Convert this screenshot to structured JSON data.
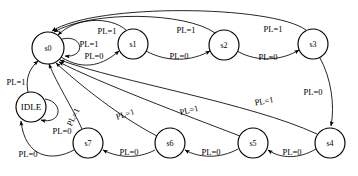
{
  "diagram": {
    "type": "finite-state-machine",
    "title": "",
    "canvas": {
      "width": 358,
      "height": 176
    },
    "stroke_color": "#000000",
    "fill_color": "#ffffff",
    "background": "#ffffff",
    "states": [
      {
        "id": "s0",
        "label": "s0",
        "cx": 48,
        "cy": 48,
        "r": 16
      },
      {
        "id": "s1",
        "label": "s1",
        "cx": 133,
        "cy": 44,
        "r": 15
      },
      {
        "id": "s2",
        "label": "s2",
        "cx": 224,
        "cy": 45,
        "r": 15
      },
      {
        "id": "s3",
        "label": "s3",
        "cx": 313,
        "cy": 44,
        "r": 15
      },
      {
        "id": "s4",
        "label": "s4",
        "cx": 330,
        "cy": 143,
        "r": 15
      },
      {
        "id": "s5",
        "label": "s5",
        "cx": 253,
        "cy": 143,
        "r": 15
      },
      {
        "id": "s6",
        "label": "s6",
        "cx": 170,
        "cy": 143,
        "r": 15
      },
      {
        "id": "s7",
        "label": "s7",
        "cx": 88,
        "cy": 143,
        "r": 15
      },
      {
        "id": "IDLE",
        "label": "IDLE",
        "cx": 31,
        "cy": 107,
        "r": 15
      }
    ],
    "transitions": [
      {
        "id": "t-s0-s0",
        "from": "s0",
        "to": "s0",
        "label": "PL=1",
        "label_x": 89,
        "label_y": 44
      },
      {
        "id": "t-s0-s1",
        "from": "s0",
        "to": "s1",
        "label": "PL=0",
        "label_x": 94,
        "label_y": 56
      },
      {
        "id": "t-s1-s0",
        "from": "s1",
        "to": "s0",
        "label": "PL=1",
        "label_x": 107,
        "label_y": 31
      },
      {
        "id": "t-s1-s2",
        "from": "s1",
        "to": "s2",
        "label": "PL=0",
        "label_x": 179,
        "label_y": 56
      },
      {
        "id": "t-s2-s0",
        "from": "s2",
        "to": "s0",
        "label": "PL=1",
        "label_x": 186,
        "label_y": 30
      },
      {
        "id": "t-s2-s3",
        "from": "s2",
        "to": "s3",
        "label": "PL=0",
        "label_x": 268,
        "label_y": 57
      },
      {
        "id": "t-s3-s0",
        "from": "s3",
        "to": "s0",
        "label": "PL=1",
        "label_x": 273,
        "label_y": 29
      },
      {
        "id": "t-s3-s4",
        "from": "s3",
        "to": "s4",
        "label": "PL=0",
        "label_x": 313,
        "label_y": 92
      },
      {
        "id": "t-s4-s0",
        "from": "s4",
        "to": "s0",
        "label": "PL=1",
        "label_x": 264,
        "label_y": 101
      },
      {
        "id": "t-s4-s5",
        "from": "s4",
        "to": "s5",
        "label": "PL=0",
        "label_x": 292,
        "label_y": 152
      },
      {
        "id": "t-s5-s0",
        "from": "s5",
        "to": "s0",
        "label": "PL=1",
        "label_x": 189,
        "label_y": 110
      },
      {
        "id": "t-s5-s6",
        "from": "s5",
        "to": "s6",
        "label": "PL=0",
        "label_x": 211,
        "label_y": 152
      },
      {
        "id": "t-s6-s0",
        "from": "s6",
        "to": "s0",
        "label": "PL=1",
        "label_x": 125,
        "label_y": 114
      },
      {
        "id": "t-s6-s7",
        "from": "s6",
        "to": "s7",
        "label": "PL=0",
        "label_x": 129,
        "label_y": 152
      },
      {
        "id": "t-s7-s0",
        "from": "s7",
        "to": "s0",
        "label": "PL=1",
        "label_x": 73,
        "label_y": 117
      },
      {
        "id": "t-s7-idle",
        "from": "s7",
        "to": "IDLE",
        "label": "PL=0",
        "label_x": 28,
        "label_y": 154
      },
      {
        "id": "t-idle-idle",
        "from": "IDLE",
        "to": "IDLE",
        "label": "PL=0",
        "label_x": 62,
        "label_y": 131
      },
      {
        "id": "t-idle-s0",
        "from": "IDLE",
        "to": "s0",
        "label": "PL=1",
        "label_x": 16,
        "label_y": 82
      }
    ]
  }
}
